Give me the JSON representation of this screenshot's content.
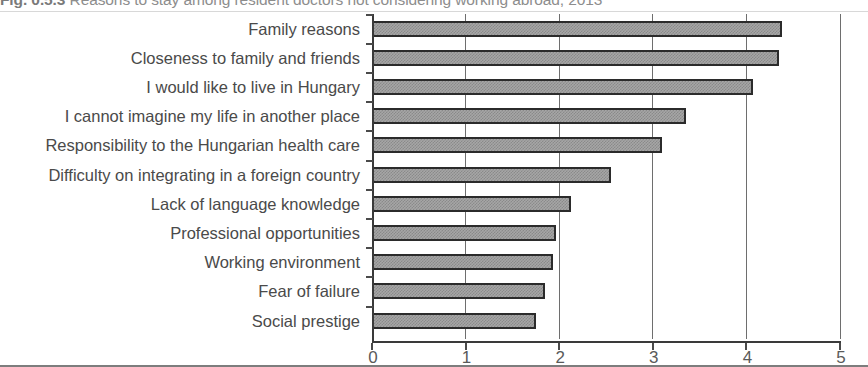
{
  "figure": {
    "number": "Fig. 0.5.3",
    "title": "Reasons to stay among resident doctors not considering working abroad, 2013",
    "title_truncated": true
  },
  "chart_data": {
    "type": "bar",
    "orientation": "horizontal",
    "title": "Fig. 0.5.3 Reasons to stay among resident doctors not considering working abroad, 2013",
    "xlabel": "",
    "ylabel": "",
    "xlim": [
      0,
      5
    ],
    "ylim": null,
    "grid": true,
    "grid_axis": "x",
    "legend": false,
    "xticks": [
      "0",
      "1",
      "2",
      "3",
      "4",
      "5"
    ],
    "xtick_values": [
      0,
      1,
      2,
      3,
      4,
      5
    ],
    "categories": [
      "Family reasons",
      "Closeness to family and friends",
      "I would like to live in Hungary",
      "I cannot imagine my life in another place",
      "Responsibility to the Hungarian health care",
      "Difficulty on integrating in a foreign country",
      "Lack of language knowledge",
      "Professional opportunities",
      "Working environment",
      "Fear of failure",
      "Social prestige"
    ],
    "values": [
      4.38,
      4.35,
      4.07,
      3.35,
      3.1,
      2.55,
      2.13,
      1.97,
      1.93,
      1.85,
      1.75
    ],
    "series": [
      {
        "name": "Mean score",
        "values": [
          4.38,
          4.35,
          4.07,
          3.35,
          3.1,
          2.55,
          2.13,
          1.97,
          1.93,
          1.85,
          1.75
        ]
      }
    ],
    "bar_fill_color": "#a6a6a6",
    "bar_edge_color": "#2b2b2b",
    "axis_color": "#3a3a3a",
    "grid_color": "#6e6e6e",
    "text_color": "#4a4a4a"
  }
}
